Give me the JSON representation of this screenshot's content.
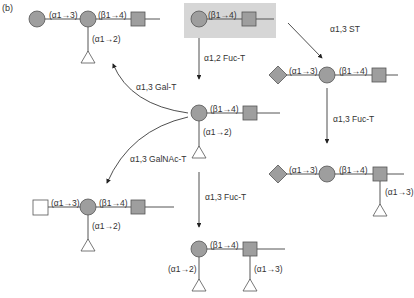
{
  "panel_label": "(b)",
  "colors": {
    "highlight_box": "#d6d6d6",
    "sugar_fill": "#9e9e9e",
    "sugar_stroke": "#555555",
    "line": "#555555",
    "open_fill": "#ffffff"
  },
  "legend_shapes": {
    "circle": "Gal (gray circle)",
    "square_gray": "GlcNAc (gray square)",
    "square_open": "GalNAc (open square)",
    "triangle": "Fuc (open triangle)",
    "diamond": "Sia (gray diamond)"
  },
  "nodes": {
    "precursor": {
      "linkage_main": "(β1→4)"
    },
    "a_antigen_top": {
      "linkage_left": "(α1→3)",
      "linkage_main": "(β1→4)",
      "linkage_fuc": "(α1→2)"
    },
    "h_antigen": {
      "linkage_main": "(β1→4)",
      "linkage_fuc": "(α1→2)"
    },
    "sialyl": {
      "linkage_left": "(α1→3)",
      "linkage_main": "(β1→4)"
    },
    "sialyl_lewis_x": {
      "linkage_left": "(α1→3)",
      "linkage_main": "(β1→4)",
      "linkage_fuc": "(α1→3)"
    },
    "a_antigen_bottom": {
      "linkage_left": "(α1→3)",
      "linkage_main": "(β1→4)",
      "linkage_fuc": "(α1→2)"
    },
    "lewis_y": {
      "linkage_main": "(β1→4)",
      "linkage_fuc_gal": "(α1→2)",
      "linkage_fuc_glcnac": "(α1→3)"
    }
  },
  "enzymes": {
    "fuc_t_12": "α1,2 Fuc-T",
    "st_13": "α1,3 ST",
    "gal_t_13": "α1,3 Gal-T",
    "galnac_t_13": "α1,3 GalNAc-T",
    "fuc_t_13_right": "α1,3 Fuc-T",
    "fuc_t_13_center": "α1,3 Fuc-T"
  }
}
